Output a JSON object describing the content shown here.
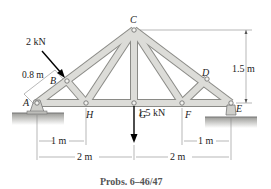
{
  "figure": {
    "caption": "Probs. 6–46/47",
    "joints": {
      "A": "A",
      "B": "B",
      "C": "C",
      "D": "D",
      "E": "E",
      "F": "F",
      "G": "G",
      "H": "H"
    },
    "loads": {
      "inclined_load": "2 kN",
      "vertical_load": "1.5 kN"
    },
    "dimensions": {
      "ab_length": "0.8 m",
      "height": "1.5 m",
      "ah": "1 m",
      "ag": "2 m",
      "fe": "1 m",
      "ge": "2 m"
    },
    "colors": {
      "member_fill": "#d9d9d6",
      "member_stroke": "#8a8a86",
      "text": "#222222",
      "caption": "#555555"
    }
  }
}
